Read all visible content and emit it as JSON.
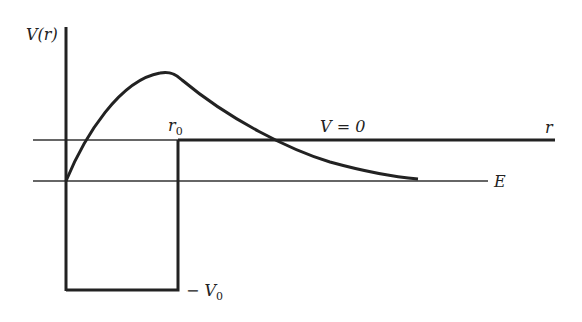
{
  "diagram": {
    "labels": {
      "y_axis": "V(r)",
      "x_axis": "r",
      "r0_main": "r",
      "r0_sub": "0",
      "zero_line": "V = 0",
      "energy": "E",
      "depth_prefix": "− V",
      "depth_sub": "0"
    },
    "colors": {
      "line": "#222222",
      "background": "#ffffff"
    }
  }
}
